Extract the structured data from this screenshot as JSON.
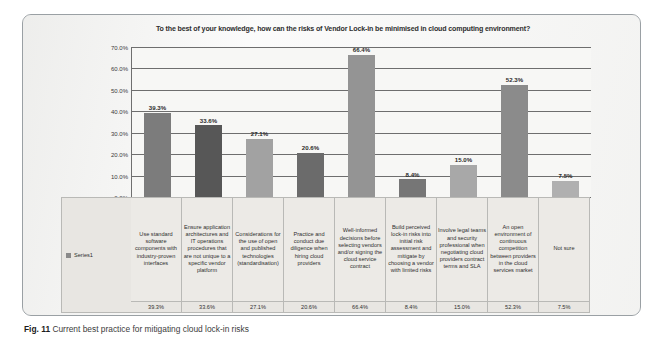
{
  "figure": {
    "caption_label": "Fig. 11",
    "caption_text": "Current best practice for mitigating cloud lock-in risks"
  },
  "legend": {
    "series_name": "Series1",
    "swatch_color": "#8a8a8a"
  },
  "chart_data": {
    "type": "bar",
    "title": "To the best of your knowledge, how can the risks of Vendor Lock-in be minimised in cloud computing environment?",
    "xlabel": "",
    "ylabel": "",
    "ylim": [
      0,
      70
    ],
    "grid": true,
    "legend_position": "bottom-table",
    "ytick_labels": [
      "70.0%",
      "60.0%",
      "50.0%",
      "40.0%",
      "30.0%",
      "20.0%",
      "10.0%",
      "0.0%"
    ],
    "yticks": [
      70,
      60,
      50,
      40,
      30,
      20,
      10,
      0
    ],
    "categories": [
      "Use standard software components with industry-proven interfaces",
      "Ensure application architectures and IT operations procedures that are not unique to a specific vendor platform",
      "Considerations for the use of open and published technologies (standardisation)",
      "Practice and conduct due diligence when hiring cloud providers",
      "Well-informed decisions before selecting vendors and/or signing the cloud service contract",
      "Build perceived lock-in risks into initial risk assessment and mitigate by choosing a vendor with limited risks",
      "Involve legal teams and security professional when negotiating cloud providers contract terms and SLA",
      "An open environment of continuous competition between providers in the cloud services market",
      "Not sure"
    ],
    "values": [
      39.3,
      33.6,
      27.1,
      20.6,
      66.4,
      8.4,
      15.0,
      52.3,
      7.5
    ],
    "value_labels": [
      "39.3%",
      "33.6%",
      "27.1%",
      "20.6%",
      "66.4%",
      "8.4%",
      "15.0%",
      "52.3%",
      "7.5%"
    ],
    "bar_colors": [
      "#7c7c7c",
      "#575757",
      "#a2a2a2",
      "#6b6b6b",
      "#949494",
      "#767676",
      "#a8a8a8",
      "#8b8b8b",
      "#b0b0b0"
    ],
    "series": [
      {
        "name": "Series1",
        "values": [
          39.3,
          33.6,
          27.1,
          20.6,
          66.4,
          8.4,
          15.0,
          52.3,
          7.5
        ]
      }
    ]
  }
}
